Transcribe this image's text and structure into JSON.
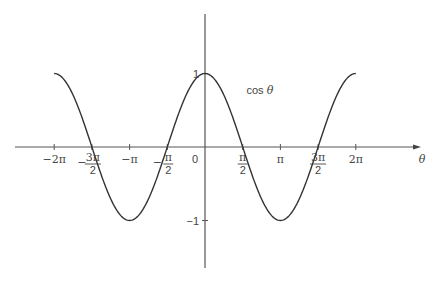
{
  "chart_data": {
    "type": "line",
    "title": "",
    "xlabel": "θ",
    "ylabel": "",
    "xlim_pi": [
      -2.45,
      2.9
    ],
    "ylim": [
      -1.7,
      2.2
    ],
    "grid": false,
    "series": [
      {
        "name": "cos θ",
        "function": "cos",
        "domain_pi": [
          -2,
          2
        ],
        "x_pi": [
          -2,
          -1.75,
          -1.5,
          -1.25,
          -1,
          -0.75,
          -0.5,
          -0.25,
          0,
          0.25,
          0.5,
          0.75,
          1,
          1.25,
          1.5,
          1.75,
          2
        ],
        "values": [
          1,
          0.707,
          0,
          -0.707,
          -1,
          -0.707,
          0,
          0.707,
          1,
          0.707,
          0,
          -0.707,
          -1,
          -0.707,
          0,
          0.707,
          1
        ]
      }
    ],
    "curve_label": {
      "text": "cos θ",
      "x_pi": 0.55,
      "y": 0.72
    },
    "x_ticks": [
      {
        "value_pi": -2,
        "label": "−2π",
        "kind": "simple"
      },
      {
        "value_pi": -1.5,
        "sign": "−",
        "num": "3π",
        "den": "2",
        "kind": "fraction"
      },
      {
        "value_pi": -1,
        "label": "−π",
        "kind": "simple"
      },
      {
        "value_pi": -0.5,
        "sign": "−",
        "num": "π",
        "den": "2",
        "kind": "fraction"
      },
      {
        "value_pi": 0.5,
        "sign": "",
        "num": "π",
        "den": "2",
        "kind": "fraction"
      },
      {
        "value_pi": 1,
        "label": "π",
        "kind": "simple"
      },
      {
        "value_pi": 1.5,
        "sign": "",
        "num": "3π",
        "den": "2",
        "kind": "fraction"
      },
      {
        "value_pi": 2,
        "label": "2π",
        "kind": "simple"
      }
    ],
    "origin_label": "0",
    "y_ticks": [
      {
        "value": 1,
        "label": "1"
      },
      {
        "value": -1,
        "label": "−1"
      }
    ],
    "colors": {
      "axis": "#555555",
      "curve": "#333333",
      "text": "#444444"
    }
  }
}
